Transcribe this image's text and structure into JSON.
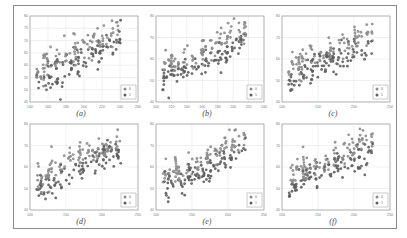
{
  "figure": {
    "panels": [
      {
        "id": "a",
        "caption": "(a)"
      },
      {
        "id": "b",
        "caption": "(b)"
      },
      {
        "id": "c",
        "caption": "(c)"
      },
      {
        "id": "d",
        "caption": "(d)"
      },
      {
        "id": "e",
        "caption": "(e)"
      },
      {
        "id": "f",
        "caption": "(f)"
      }
    ],
    "legend": [
      "0",
      "1"
    ],
    "colors": {
      "class0": "#8c8c8c",
      "class1": "#5e5e5e",
      "grid": "#e6e6e6",
      "axis": "#9a9a9a"
    }
  },
  "chart_data": [
    {
      "type": "scatter",
      "title": "(a)",
      "xlim": [
        140,
        260
      ],
      "ylim": [
        45,
        80
      ],
      "xticks": [
        140,
        160,
        180,
        200,
        220,
        240,
        260
      ],
      "yticks": [
        45,
        50,
        55,
        60,
        65,
        70,
        75,
        80
      ],
      "legend": [
        "0",
        "1"
      ],
      "legend_position": "lower right",
      "grid": true,
      "series": [
        {
          "name": "0",
          "trend": "rising cluster, upper-left to upper-right"
        },
        {
          "name": "1",
          "trend": "rising cluster, lower band"
        }
      ]
    },
    {
      "type": "scatter",
      "title": "(b)",
      "xlim": [
        100,
        240
      ],
      "ylim": [
        40,
        80
      ],
      "xticks": [
        100,
        120,
        140,
        160,
        180,
        200,
        220,
        240
      ],
      "yticks": [
        40,
        50,
        60,
        70,
        80
      ],
      "legend": [
        "0",
        "1"
      ],
      "legend_position": "lower right",
      "grid": true,
      "series": [
        {
          "name": "0"
        },
        {
          "name": "1"
        }
      ]
    },
    {
      "type": "scatter",
      "title": "(c)",
      "xlim": [
        100,
        250
      ],
      "ylim": [
        40,
        80
      ],
      "xticks": [
        100,
        150,
        200,
        250
      ],
      "yticks": [
        40,
        50,
        60,
        70,
        80
      ],
      "legend": [
        "0",
        "1"
      ],
      "legend_position": "lower right",
      "grid": true,
      "series": [
        {
          "name": "0"
        },
        {
          "name": "1"
        }
      ]
    },
    {
      "type": "scatter",
      "title": "(d)",
      "xlim": [
        100,
        250
      ],
      "ylim": [
        40,
        80
      ],
      "xticks": [
        100,
        150,
        200,
        250
      ],
      "yticks": [
        40,
        50,
        60,
        70,
        80
      ],
      "legend": [
        "0",
        "1"
      ],
      "legend_position": "lower right",
      "grid": true,
      "series": [
        {
          "name": "0"
        },
        {
          "name": "1"
        }
      ]
    },
    {
      "type": "scatter",
      "title": "(e)",
      "xlim": [
        100,
        250
      ],
      "ylim": [
        40,
        80
      ],
      "xticks": [
        100,
        150,
        200,
        250
      ],
      "yticks": [
        40,
        50,
        60,
        70,
        80
      ],
      "legend": [
        "0",
        "1"
      ],
      "legend_position": "lower right",
      "grid": true,
      "series": [
        {
          "name": "0"
        },
        {
          "name": "1"
        }
      ]
    },
    {
      "type": "scatter",
      "title": "(f)",
      "xlim": [
        100,
        250
      ],
      "ylim": [
        40,
        80
      ],
      "xticks": [
        100,
        150,
        200,
        250
      ],
      "yticks": [
        40,
        50,
        60,
        70,
        80
      ],
      "legend": [
        "0",
        "1"
      ],
      "legend_position": "lower right",
      "grid": true,
      "series": [
        {
          "name": "0"
        },
        {
          "name": "1"
        }
      ]
    }
  ]
}
